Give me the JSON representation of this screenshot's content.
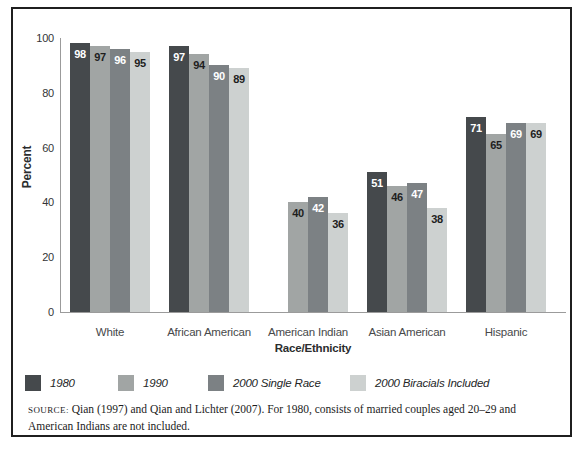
{
  "chart_data": {
    "type": "bar",
    "title": "",
    "xlabel": "Race/Ethnicity",
    "ylabel": "Percent",
    "ylim": [
      0,
      100
    ],
    "yticks": [
      0,
      20,
      40,
      60,
      80,
      100
    ],
    "grid": false,
    "legend_position": "bottom",
    "categories": [
      "White",
      "African American",
      "American Indian",
      "Asian American",
      "Hispanic"
    ],
    "series": [
      {
        "name": "1980",
        "color": "#45494c",
        "label_color": "#ffffff",
        "values": [
          98,
          97,
          null,
          51,
          71
        ]
      },
      {
        "name": "1990",
        "color": "#a1a5a4",
        "label_color": "#1e1e1e",
        "values": [
          97,
          94,
          40,
          46,
          65
        ]
      },
      {
        "name": "2000 Single Race",
        "color": "#7c8184",
        "label_color": "#ffffff",
        "values": [
          96,
          90,
          42,
          47,
          69
        ]
      },
      {
        "name": "2000 Biracials Included",
        "color": "#cdd1d0",
        "label_color": "#1e1e1e",
        "values": [
          95,
          89,
          36,
          38,
          69
        ]
      }
    ]
  },
  "axis": {
    "y_title": "Percent",
    "x_title": "Race/Ethnicity"
  },
  "source": {
    "prefix": "SOURCE:",
    "line1": "Qian (1997) and Qian and Lichter (2007). For 1980, consists of married couples aged 20–29 and",
    "line2": "American Indians are not included."
  },
  "style": {
    "frame_border_color": "#1f1f1f",
    "axis_color": "#9b9b9b",
    "tick_text_color": "#333537",
    "category_text_color": "#47494a",
    "background": "#ffffff"
  },
  "legend_item_lefts": [
    12,
    105,
    195,
    337
  ]
}
